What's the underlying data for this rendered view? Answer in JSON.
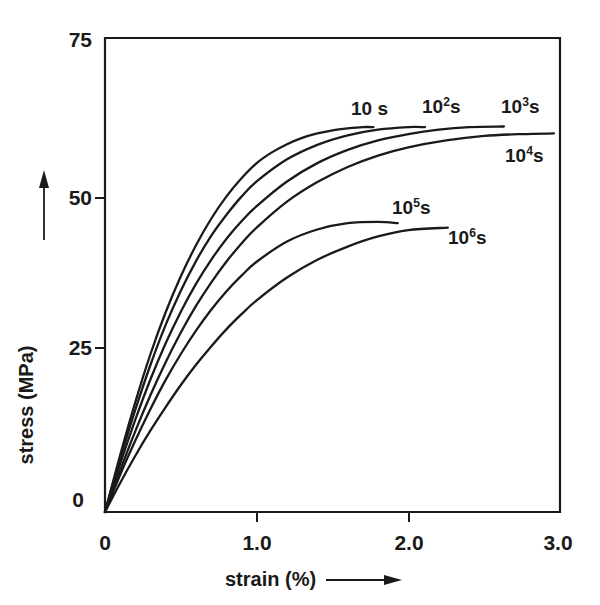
{
  "figure": {
    "background": "#ffffff",
    "ink_color": "#1a1a1a"
  },
  "chart_data": {
    "type": "line",
    "title": "",
    "subtitle": "",
    "xlabel": "strain (%)",
    "ylabel": "stress (MPa)",
    "xlim": [
      0,
      3.0
    ],
    "ylim": [
      0,
      75
    ],
    "xticks": [
      "0",
      "1.0",
      "2.0",
      "3.0"
    ],
    "xtick_values": [
      0,
      1.0,
      2.0,
      3.0
    ],
    "yticks": [
      "0",
      "25",
      "50",
      "75"
    ],
    "ytick_values": [
      0,
      25,
      50,
      75
    ],
    "grid": false,
    "legend_position": "inline-curve-labels",
    "annotations": [
      {
        "text": "10 s",
        "x": 1.62,
        "y": 63.5
      },
      {
        "text": "10²s",
        "x": 2.09,
        "y": 64.2
      },
      {
        "text": "10³s",
        "x": 2.61,
        "y": 64.2
      },
      {
        "text": "10⁴s",
        "x": 2.64,
        "y": 56.4
      },
      {
        "text": "10⁵s",
        "x": 1.89,
        "y": 48.2
      },
      {
        "text": "10⁶s",
        "x": 2.26,
        "y": 43.5
      }
    ],
    "series": [
      {
        "name": "10 s",
        "label": "10 s",
        "label_html": "10 s",
        "points": [
          [
            0.0,
            0.0
          ],
          [
            0.1,
            9.0
          ],
          [
            0.2,
            17.4
          ],
          [
            0.3,
            25.0
          ],
          [
            0.4,
            31.6
          ],
          [
            0.5,
            37.3
          ],
          [
            0.6,
            42.2
          ],
          [
            0.7,
            46.4
          ],
          [
            0.8,
            49.9
          ],
          [
            0.9,
            52.8
          ],
          [
            1.0,
            55.2
          ],
          [
            1.1,
            56.9
          ],
          [
            1.2,
            58.2
          ],
          [
            1.3,
            59.2
          ],
          [
            1.4,
            59.9
          ],
          [
            1.5,
            60.4
          ],
          [
            1.6,
            60.7
          ],
          [
            1.7,
            60.9
          ],
          [
            1.77,
            60.9
          ]
        ]
      },
      {
        "name": "10^2 s",
        "label": "10²s",
        "label_html": "10<sup>2</sup>s",
        "points": [
          [
            0.0,
            0.0
          ],
          [
            0.1,
            8.4
          ],
          [
            0.2,
            16.2
          ],
          [
            0.3,
            23.3
          ],
          [
            0.4,
            29.6
          ],
          [
            0.5,
            35.0
          ],
          [
            0.6,
            39.7
          ],
          [
            0.7,
            43.7
          ],
          [
            0.8,
            47.0
          ],
          [
            0.9,
            49.9
          ],
          [
            1.0,
            52.3
          ],
          [
            1.2,
            55.8
          ],
          [
            1.4,
            58.1
          ],
          [
            1.6,
            59.6
          ],
          [
            1.8,
            60.5
          ],
          [
            2.0,
            60.9
          ],
          [
            2.11,
            60.9
          ]
        ]
      },
      {
        "name": "10^3 s",
        "label": "10³s",
        "label_html": "10<sup>3</sup>s",
        "points": [
          [
            0.0,
            0.0
          ],
          [
            0.1,
            7.6
          ],
          [
            0.2,
            14.6
          ],
          [
            0.3,
            21.0
          ],
          [
            0.4,
            26.7
          ],
          [
            0.5,
            31.7
          ],
          [
            0.6,
            36.1
          ],
          [
            0.7,
            39.9
          ],
          [
            0.8,
            43.2
          ],
          [
            0.9,
            46.0
          ],
          [
            1.0,
            48.4
          ],
          [
            1.2,
            52.3
          ],
          [
            1.4,
            55.2
          ],
          [
            1.6,
            57.3
          ],
          [
            1.8,
            58.8
          ],
          [
            2.0,
            59.8
          ],
          [
            2.2,
            60.5
          ],
          [
            2.4,
            60.9
          ],
          [
            2.63,
            61.0
          ]
        ]
      },
      {
        "name": "10^4 s",
        "label": "10⁴s",
        "label_html": "10<sup>4</sup>s",
        "points": [
          [
            0.0,
            0.0
          ],
          [
            0.1,
            6.6
          ],
          [
            0.2,
            12.8
          ],
          [
            0.3,
            18.5
          ],
          [
            0.4,
            23.7
          ],
          [
            0.5,
            28.4
          ],
          [
            0.6,
            32.6
          ],
          [
            0.7,
            36.3
          ],
          [
            0.8,
            39.6
          ],
          [
            0.9,
            42.5
          ],
          [
            1.0,
            45.0
          ],
          [
            1.2,
            49.1
          ],
          [
            1.4,
            52.2
          ],
          [
            1.6,
            54.6
          ],
          [
            1.8,
            56.4
          ],
          [
            2.0,
            57.7
          ],
          [
            2.25,
            58.8
          ],
          [
            2.5,
            59.5
          ],
          [
            2.75,
            59.8
          ],
          [
            2.96,
            59.9
          ]
        ]
      },
      {
        "name": "10^5 s",
        "label": "10⁵s",
        "label_html": "10<sup>5</sup>s",
        "points": [
          [
            0.0,
            0.0
          ],
          [
            0.1,
            5.9
          ],
          [
            0.2,
            11.3
          ],
          [
            0.3,
            16.3
          ],
          [
            0.4,
            20.9
          ],
          [
            0.5,
            25.0
          ],
          [
            0.6,
            28.7
          ],
          [
            0.7,
            32.0
          ],
          [
            0.8,
            34.9
          ],
          [
            0.9,
            37.4
          ],
          [
            1.0,
            39.6
          ],
          [
            1.2,
            42.8
          ],
          [
            1.4,
            44.7
          ],
          [
            1.6,
            45.7
          ],
          [
            1.8,
            45.9
          ],
          [
            1.93,
            45.7
          ]
        ]
      },
      {
        "name": "10^6 s",
        "label": "10⁶s",
        "label_html": "10<sup>6</sup>s",
        "points": [
          [
            0.0,
            0.0
          ],
          [
            0.1,
            4.6
          ],
          [
            0.2,
            8.9
          ],
          [
            0.3,
            12.9
          ],
          [
            0.4,
            16.6
          ],
          [
            0.5,
            20.1
          ],
          [
            0.6,
            23.3
          ],
          [
            0.7,
            26.2
          ],
          [
            0.8,
            28.9
          ],
          [
            0.9,
            31.3
          ],
          [
            1.0,
            33.5
          ],
          [
            1.2,
            37.1
          ],
          [
            1.4,
            39.9
          ],
          [
            1.6,
            42.0
          ],
          [
            1.8,
            43.6
          ],
          [
            2.0,
            44.6
          ],
          [
            2.26,
            45.0
          ]
        ]
      }
    ]
  }
}
